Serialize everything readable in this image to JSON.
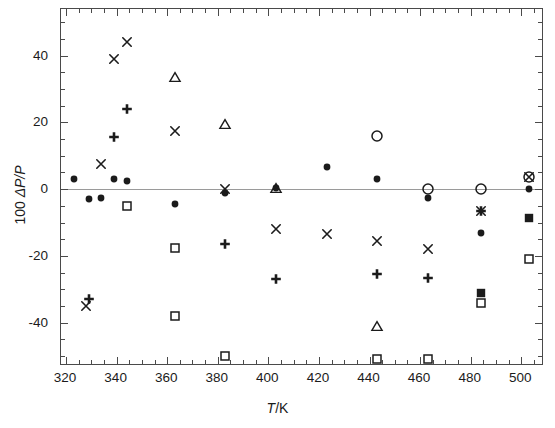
{
  "chart_data": {
    "type": "scatter",
    "title": "",
    "xlabel": "T/K",
    "ylabel": "100 ΔP/P",
    "xlim": [
      318,
      509
    ],
    "ylim": [
      -53,
      54
    ],
    "xticks": [
      320,
      340,
      360,
      380,
      400,
      420,
      440,
      460,
      480,
      500
    ],
    "yticks": [
      40,
      20,
      0,
      -20,
      -40
    ],
    "xtick_minor_step": 5,
    "ytick_minor_step": 5,
    "grid": false,
    "zero_line": true,
    "legend": "none",
    "series": [
      {
        "name": "filled-circle",
        "marker": "filled-circle",
        "points": [
          [
            323,
            3
          ],
          [
            329,
            -3
          ],
          [
            334,
            -2.5
          ],
          [
            339,
            3
          ],
          [
            344,
            2.5
          ],
          [
            363,
            -4.5
          ],
          [
            383,
            -1
          ],
          [
            403,
            0.5
          ],
          [
            423,
            6.5
          ],
          [
            443,
            3
          ],
          [
            463,
            -2.5
          ],
          [
            484,
            -13
          ],
          [
            503,
            0
          ]
        ]
      },
      {
        "name": "cross",
        "marker": "cross",
        "points": [
          [
            334,
            7.5
          ],
          [
            339,
            39
          ],
          [
            344,
            44
          ],
          [
            363,
            17.5
          ],
          [
            383,
            0
          ],
          [
            403,
            -12
          ],
          [
            423,
            -13.5
          ],
          [
            443,
            -15.5
          ],
          [
            463,
            -18
          ],
          [
            484,
            -6.5
          ],
          [
            503,
            3.5
          ]
        ]
      },
      {
        "name": "plus",
        "marker": "plus",
        "points": [
          [
            329,
            -33
          ],
          [
            339,
            15.5
          ],
          [
            344,
            24
          ],
          [
            383,
            -16.5
          ],
          [
            403,
            -27
          ],
          [
            443,
            -25.5
          ],
          [
            463,
            -26.5
          ],
          [
            484,
            -6.5
          ]
        ]
      },
      {
        "name": "open-triangle",
        "marker": "open-triangle",
        "points": [
          [
            363,
            33.5
          ],
          [
            383,
            19.5
          ],
          [
            403,
            0.5
          ],
          [
            443,
            -41
          ]
        ]
      },
      {
        "name": "open-square",
        "marker": "open-square",
        "points": [
          [
            344,
            -5
          ],
          [
            363,
            -17.5
          ],
          [
            363,
            -38
          ],
          [
            383,
            -50
          ],
          [
            443,
            -51
          ],
          [
            463,
            -51
          ],
          [
            484,
            -34
          ],
          [
            503,
            -21
          ]
        ]
      },
      {
        "name": "open-circle",
        "marker": "open-circle",
        "points": [
          [
            443,
            16
          ],
          [
            463,
            0
          ],
          [
            484,
            0
          ],
          [
            503,
            3.5
          ]
        ]
      },
      {
        "name": "filled-square",
        "marker": "filled-square",
        "points": [
          [
            484,
            -31
          ],
          [
            503,
            -8.5
          ]
        ]
      },
      {
        "name": "small-cross",
        "marker": "cross",
        "points": [
          [
            328,
            -35
          ]
        ]
      }
    ]
  },
  "axes": {
    "x_title_prefix": "T",
    "x_title_suffix": "/K",
    "y_title_prefix": "100 ",
    "y_title_mid": "ΔP/P",
    "xtick_labels": [
      "320",
      "340",
      "360",
      "380",
      "400",
      "420",
      "440",
      "460",
      "480",
      "500"
    ],
    "ytick_labels": [
      "40",
      "20",
      "0",
      "-20",
      "-40"
    ]
  },
  "colors": {
    "frame": "#4a4a4a",
    "marker": "#1b1b1b",
    "zero_line": "#9a9a9a",
    "background": "#ffffff",
    "text": "#1b1b1b"
  }
}
